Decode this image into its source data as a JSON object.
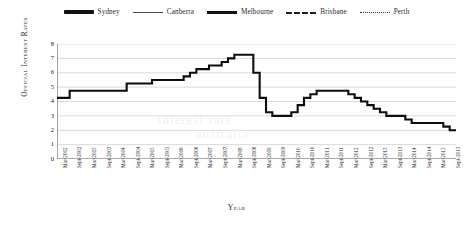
{
  "legend": {
    "position": "top-center",
    "items": [
      {
        "label": "Sydney",
        "style": "solid-thick",
        "swatch": "sw-sydney"
      },
      {
        "label": "Canberra",
        "style": "solid-thin",
        "swatch": "sw-canberra"
      },
      {
        "label": "Melbourne",
        "style": "solid-medium",
        "swatch": "sw-melbourne"
      },
      {
        "label": "Brisbane",
        "style": "dashed",
        "swatch": "sw-brisbane"
      },
      {
        "label": "Perth",
        "style": "dotted",
        "swatch": "sw-perth"
      }
    ]
  },
  "axes": {
    "ylabel": "Official Interest Rates",
    "xlabel": "Year"
  },
  "watermark": {
    "line1": "interest rate",
    "line2": "australia"
  },
  "chart_data": {
    "type": "line",
    "title": "",
    "subtitle": "",
    "xlabel": "Year",
    "ylabel": "Official Interest Rates",
    "ylim": [
      0,
      8
    ],
    "yticks": [
      0,
      1,
      2,
      3,
      4,
      5,
      6,
      7,
      8
    ],
    "grid": true,
    "grid_axis": "y",
    "legend_position": "top-center",
    "legend_entries": [
      "Sydney",
      "Canberra",
      "Melbourne",
      "Brisbane",
      "Perth"
    ],
    "x": [
      "Mar-2002",
      "Sept-2002",
      "Mar-2003",
      "Sept-2003",
      "Mar-2004",
      "Sept-2004",
      "Mar-2005",
      "Sept-2005",
      "Mar-2006",
      "Sept-2006",
      "Mar-2007",
      "Sept-2007",
      "Mar-2008",
      "Sept-2008",
      "Mar-2009",
      "Sept-2009",
      "Mar-2010",
      "Sept-2010",
      "Mar-2011",
      "Sept-2011",
      "Mar-2012",
      "Sept-2012",
      "Mar-2013",
      "Sept-2013",
      "Mar-2014",
      "Sept-2014",
      "Mar-2015",
      "Sept-2015"
    ],
    "series": [
      {
        "name": "Sydney",
        "style": "solid-thick",
        "values": [
          4.25,
          4.75,
          4.75,
          4.75,
          4.75,
          4.75,
          5.25,
          5.5,
          5.5,
          5.5,
          5.75,
          6.25,
          6.5,
          7.25,
          7.25,
          3.0,
          3.0,
          3.75,
          4.75,
          4.75,
          4.75,
          4.25,
          3.5,
          3.0,
          2.5,
          2.5,
          2.25,
          2.0
        ]
      }
    ],
    "detail_points": {
      "note": "Stepped rate-decision curve read off the plotted line",
      "values": [
        4.25,
        4.25,
        4.75,
        4.75,
        4.75,
        4.75,
        4.75,
        4.75,
        4.75,
        4.75,
        4.75,
        5.25,
        5.25,
        5.25,
        5.25,
        5.5,
        5.5,
        5.5,
        5.5,
        5.5,
        5.75,
        6.0,
        6.25,
        6.25,
        6.5,
        6.5,
        6.75,
        7.0,
        7.25,
        7.25,
        7.25,
        6.0,
        4.25,
        3.25,
        3.0,
        3.0,
        3.0,
        3.25,
        3.75,
        4.25,
        4.5,
        4.75,
        4.75,
        4.75,
        4.75,
        4.75,
        4.5,
        4.25,
        4.0,
        3.75,
        3.5,
        3.25,
        3.0,
        3.0,
        3.0,
        2.75,
        2.5,
        2.5,
        2.5,
        2.5,
        2.5,
        2.25,
        2.0,
        2.0
      ]
    },
    "annotations": [
      {
        "text": "peak",
        "value": 7.25,
        "x": "Sept-2008"
      },
      {
        "text": "trough",
        "value": 3.0,
        "x": "Sept-2009"
      },
      {
        "text": "end",
        "value": 2.0,
        "x": "Sept-2015"
      }
    ]
  }
}
